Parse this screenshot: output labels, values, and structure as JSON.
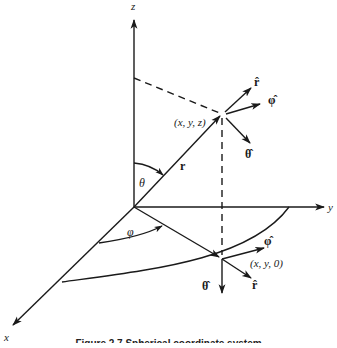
{
  "diagram": {
    "type": "spherical-coordinate-system",
    "axes": {
      "z": {
        "label": "z"
      },
      "y": {
        "label": "y"
      },
      "x": {
        "label": "x"
      }
    },
    "points": {
      "p": {
        "label": "(x, y, z)"
      },
      "q": {
        "label": "(x, y, 0)"
      }
    },
    "vectors": {
      "r": {
        "label": "r"
      }
    },
    "angles": {
      "theta": {
        "label": "θ"
      },
      "phi": {
        "label": "φ"
      }
    },
    "unit_vectors_at_p": {
      "r_hat": {
        "label": "r̂"
      },
      "phi_hat": {
        "label": "φ̂"
      },
      "theta_hat": {
        "label": "θ̂"
      }
    },
    "unit_vectors_at_q": {
      "r_hat": {
        "label": "r̂"
      },
      "phi_hat": {
        "label": "φ̂"
      },
      "theta_hat": {
        "label": "θ̂"
      }
    },
    "colors": {
      "ink": "#1a1a1a",
      "background": "#ffffff"
    }
  },
  "caption": {
    "text": "Figure 2.7  Spherical coordinate system"
  }
}
